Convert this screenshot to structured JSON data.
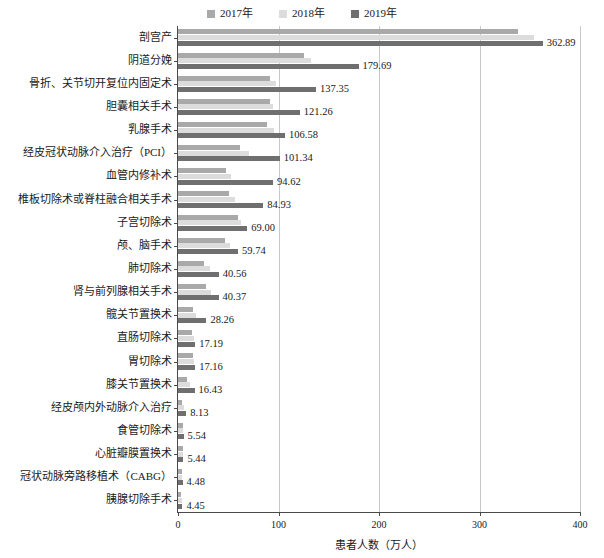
{
  "top_clipped_text": "",
  "legend": {
    "position": "top-center",
    "items": [
      {
        "label": "2017年",
        "color": "#a9a9a9"
      },
      {
        "label": "2018年",
        "color": "#dcdcdc"
      },
      {
        "label": "2019年",
        "color": "#6f6f6f"
      }
    ]
  },
  "axis": {
    "x_title": "患者人数（万人）",
    "x_ticks": [
      "0",
      "100",
      "200",
      "300",
      "400"
    ]
  },
  "chart_data": {
    "type": "bar",
    "orientation": "horizontal",
    "title": "",
    "subtitle": "",
    "xlabel": "患者人数（万人）",
    "ylabel": "",
    "xlim": [
      0,
      400
    ],
    "xticks": [
      0,
      100,
      200,
      300,
      400
    ],
    "grid": "vertical gridlines at 100, 200, 300",
    "legend_position": "top-center",
    "value_labels_series": "2019年",
    "categories": [
      "剖宫产",
      "阴道分娩",
      "骨折、关节切开复位内固定术",
      "胆囊相关手术",
      "乳腺手术",
      "经皮冠状动脉介入治疗（PCI）",
      "血管内修补术",
      "椎板切除术或脊柱融合相关手术",
      "子宫切除术",
      "颅、脑手术",
      "肺切除术",
      "肾与前列腺相关手术",
      "髋关节置换术",
      "直肠切除术",
      "胃切除术",
      "膝关节置换术",
      "经皮颅内外动脉介入治疗",
      "食管切除术",
      "心脏瓣膜置换术",
      "冠状动脉旁路移植术（CABG）",
      "胰腺切除手术"
    ],
    "series": [
      {
        "name": "2017年",
        "color": "#a9a9a9",
        "values": [
          338.0,
          125.0,
          92.0,
          92.0,
          89.0,
          62.0,
          48.0,
          51.0,
          60.0,
          47.0,
          26.0,
          28.0,
          15.0,
          14.0,
          15.0,
          8.5,
          4.0,
          5.0,
          4.6,
          4.2,
          3.1
        ]
      },
      {
        "name": "2018年",
        "color": "#dcdcdc",
        "values": [
          354.0,
          132.0,
          98.0,
          95.0,
          96.0,
          71.0,
          53.0,
          57.0,
          63.0,
          52.0,
          32.0,
          33.0,
          18.0,
          15.5,
          16.0,
          11.5,
          5.5,
          5.3,
          5.0,
          4.4,
          3.6
        ]
      },
      {
        "name": "2019年",
        "color": "#6f6f6f",
        "values": [
          362.89,
          179.69,
          137.35,
          121.26,
          106.58,
          101.34,
          94.62,
          84.93,
          69.0,
          59.74,
          40.56,
          40.37,
          28.26,
          17.19,
          17.16,
          16.43,
          8.13,
          5.54,
          5.44,
          4.48,
          4.45
        ]
      }
    ],
    "value_labels": [
      "362.89",
      "179.69",
      "137.35",
      "121.26",
      "106.58",
      "101.34",
      "94.62",
      "84.93",
      "69.00",
      "59.74",
      "40.56",
      "40.37",
      "28.26",
      "17.19",
      "17.16",
      "16.43",
      "8.13",
      "5.54",
      "5.44",
      "4.48",
      "4.45"
    ]
  }
}
